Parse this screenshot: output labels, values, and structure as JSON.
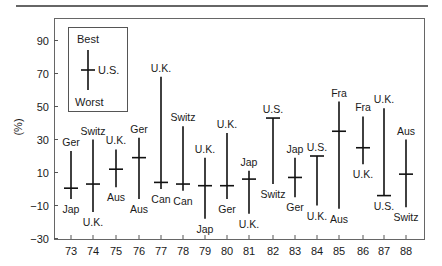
{
  "chart_data": {
    "type": "range",
    "title": "",
    "xlabel": "",
    "ylabel": "(%)",
    "ylim": [
      -30,
      100
    ],
    "yticks": [
      90,
      70,
      50,
      30,
      10,
      -10,
      -30
    ],
    "ytick_labels": [
      "90",
      "70",
      "50",
      "30",
      "10",
      "−10",
      "−30"
    ],
    "grid": false,
    "legend": {
      "position": "upper-left inset",
      "best_label": "Best",
      "worst_label": "Worst",
      "marker_label": "U.S."
    },
    "categories": [
      "73",
      "74",
      "75",
      "76",
      "77",
      "78",
      "79",
      "80",
      "81",
      "82",
      "83",
      "84",
      "85",
      "86",
      "87",
      "88"
    ],
    "series": [
      {
        "name": "Best",
        "values": [
          23,
          30,
          24,
          31,
          68,
          38,
          19,
          34,
          11,
          43,
          19,
          20,
          53,
          44,
          49,
          30
        ],
        "labels": [
          "Ger",
          "Switz",
          "U.K.",
          "Ger",
          "U.K.",
          "Switz",
          "U.K.",
          "U.K.",
          "Jap",
          "U.S.",
          "Jap",
          "U.S.",
          "Fra",
          "Fra",
          "U.K.",
          "Aus"
        ]
      },
      {
        "name": "U.S.",
        "values": [
          0.5,
          3,
          12,
          19,
          4,
          3,
          2,
          2,
          6,
          43,
          7,
          20,
          35,
          25,
          -4,
          9
        ]
      },
      {
        "name": "Worst",
        "values": [
          -6,
          -14,
          1,
          -6,
          0,
          -1,
          -18,
          -6,
          -15,
          3,
          -5,
          -10,
          -12,
          15,
          -4,
          -11
        ],
        "labels": [
          "Jap",
          "U.K.",
          "Aus",
          "Aus",
          "Can",
          "Can",
          "Jap",
          "Ger",
          "U.K.",
          "Switz",
          "Ger",
          "U.K.",
          "Aus",
          "U.K.",
          "U.S.",
          "Switz"
        ]
      }
    ]
  },
  "axis": {
    "ylabel": "(%)"
  },
  "legend": {
    "best": "Best",
    "worst": "Worst",
    "us": "U.S."
  }
}
